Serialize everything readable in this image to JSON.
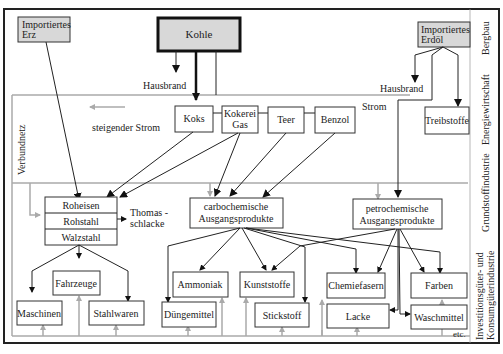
{
  "diagram": {
    "sources": {
      "erz": [
        "Importiertes",
        "Erz"
      ],
      "kohle": "Kohle",
      "erdoel": [
        "Importiertes",
        "Erdöl"
      ]
    },
    "labels": {
      "hausbrand_left": "Hausbrand",
      "hausbrand_right": "Hausbrand",
      "strom": "Strom",
      "steigender_strom": "steigender Strom",
      "verbundnetz": "Verbundnetz",
      "thomas": [
        "Thomas -",
        "schlacke"
      ],
      "etc": "etc."
    },
    "coal_products": [
      "Koks",
      [
        "Kokerei",
        "Gas"
      ],
      "Teer",
      "Benzol"
    ],
    "treibstoffe": "Treibstoffe",
    "steel": [
      "Roheisen",
      "Rohstahl",
      "Walzstahl"
    ],
    "carbo": [
      "carbochemische",
      "Ausgangsprodukte"
    ],
    "petro": [
      "petrochemische",
      "Ausgangsprodukte"
    ],
    "products": {
      "fahrzeuge": "Fahrzeuge",
      "maschinen": "Maschinen",
      "stahlwaren": "Stahlwaren",
      "ammoniak": "Ammoniak",
      "duengemittel": "Düngemittel",
      "kunststoffe": "Kunststoffe",
      "stickstoff": "Stickstoff",
      "chemiefasern": "Chemiefasern",
      "lacke": "Lacke",
      "farben": "Farben",
      "waschmittel": "Waschmittel"
    },
    "sectors": {
      "bergbau": "Bergbau",
      "energie": "Energiewirtschaft",
      "grundstoff": "Grundstoffindustrie",
      "invest": [
        "Investitionsgüter- und",
        "Konsumgüterindustrie"
      ]
    }
  }
}
